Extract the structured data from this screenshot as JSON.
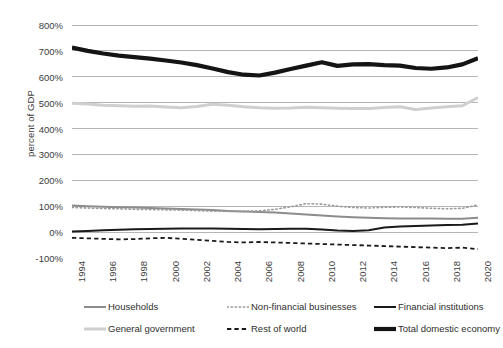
{
  "chart_data": {
    "type": "line",
    "title": "",
    "xlabel": "",
    "ylabel": "percent of GDP",
    "xlim": [
      1994,
      2020
    ],
    "ylim": [
      -100,
      800
    ],
    "ytick_suffix": "%",
    "grid": true,
    "legend_position": "bottom",
    "x": [
      1994,
      1995,
      1996,
      1997,
      1998,
      1999,
      2000,
      2001,
      2002,
      2003,
      2004,
      2005,
      2006,
      2007,
      2008,
      2009,
      2010,
      2011,
      2012,
      2013,
      2014,
      2015,
      2016,
      2017,
      2018,
      2019,
      2020
    ],
    "yticks": [
      -100,
      0,
      100,
      200,
      300,
      400,
      500,
      600,
      700,
      800
    ],
    "ytick_labels": [
      "-100%",
      "0%",
      "100%",
      "200%",
      "300%",
      "400%",
      "500%",
      "600%",
      "700%",
      "800%"
    ],
    "xtick_labels": [
      "1994",
      "1996",
      "1998",
      "2000",
      "2002",
      "2004",
      "2006",
      "2008",
      "2010",
      "2012",
      "2014",
      "2016",
      "2018",
      "2020"
    ],
    "series": [
      {
        "name": "Households",
        "color": "#8c8c8c",
        "style": "solid",
        "width": 2.0,
        "values": [
          103,
          100,
          98,
          96,
          95,
          93,
          91,
          89,
          87,
          85,
          82,
          80,
          78,
          76,
          72,
          68,
          64,
          60,
          57,
          55,
          54,
          53,
          53,
          53,
          52,
          52,
          55
        ]
      },
      {
        "name": "General government",
        "color": "#cfcfcf",
        "style": "solid",
        "width": 3.0,
        "values": [
          498,
          495,
          490,
          488,
          486,
          487,
          483,
          480,
          485,
          494,
          490,
          484,
          480,
          478,
          479,
          482,
          480,
          478,
          477,
          477,
          481,
          484,
          474,
          479,
          484,
          488,
          520
        ]
      },
      {
        "name": "Non-financial businesses",
        "color": "#9a9a9a",
        "style": "dotted",
        "width": 1.6,
        "values": [
          95,
          93,
          91,
          90,
          88,
          87,
          86,
          85,
          83,
          81,
          80,
          80,
          82,
          88,
          98,
          110,
          108,
          100,
          95,
          93,
          96,
          97,
          95,
          92,
          90,
          92,
          105
        ]
      },
      {
        "name": "Rest of world",
        "color": "#1a1a1a",
        "style": "dashed",
        "width": 1.8,
        "values": [
          -22,
          -24,
          -26,
          -28,
          -27,
          -24,
          -22,
          -26,
          -30,
          -34,
          -38,
          -40,
          -38,
          -40,
          -42,
          -44,
          -46,
          -48,
          -50,
          -52,
          -54,
          -56,
          -58,
          -60,
          -62,
          -60,
          -66
        ]
      },
      {
        "name": "Financial institutions",
        "color": "#1a1a1a",
        "style": "solid",
        "width": 2.0,
        "values": [
          2,
          4,
          7,
          9,
          11,
          12,
          13,
          14,
          14,
          14,
          13,
          12,
          11,
          12,
          13,
          13,
          10,
          6,
          4,
          7,
          18,
          22,
          24,
          26,
          27,
          28,
          33
        ]
      },
      {
        "name": "Total domestic economy",
        "color": "#141414",
        "style": "solid",
        "width": 4.2,
        "values": [
          713,
          700,
          690,
          682,
          676,
          670,
          663,
          655,
          645,
          632,
          618,
          608,
          605,
          616,
          630,
          643,
          656,
          642,
          648,
          649,
          645,
          643,
          634,
          631,
          636,
          648,
          672
        ]
      }
    ]
  },
  "legend": {
    "items": [
      {
        "label": "Households",
        "key": "households"
      },
      {
        "label": "Non-financial businesses",
        "key": "non-financial-businesses"
      },
      {
        "label": "Financial institutions",
        "key": "financial-institutions"
      },
      {
        "label": "General government",
        "key": "general-government"
      },
      {
        "label": "Rest of world",
        "key": "rest-of-world"
      },
      {
        "label": "Total domestic economy",
        "key": "total-domestic-economy"
      }
    ]
  },
  "colors": {
    "gridline": "#b5b5b5",
    "text": "#3d3d3d",
    "background": "#ffffff"
  }
}
